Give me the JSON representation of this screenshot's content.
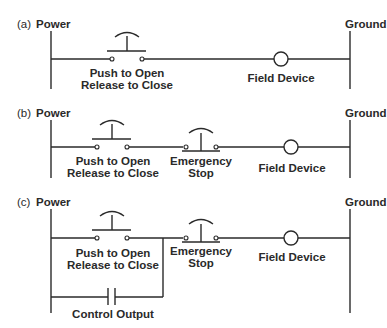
{
  "panels": [
    {
      "tag": "(a)",
      "power_label": "Power",
      "ground_label": "Ground",
      "pushbutton": {
        "line1": "Push to Open",
        "line2": "Release to Close"
      },
      "field_device": "Field Device"
    },
    {
      "tag": "(b)",
      "power_label": "Power",
      "ground_label": "Ground",
      "pushbutton": {
        "line1": "Push to Open",
        "line2": "Release to Close"
      },
      "estop": {
        "line1": "Emergency",
        "line2": "Stop"
      },
      "field_device": "Field Device"
    },
    {
      "tag": "(c)",
      "power_label": "Power",
      "ground_label": "Ground",
      "pushbutton": {
        "line1": "Push to Open",
        "line2": "Release to Close"
      },
      "estop": {
        "line1": "Emergency",
        "line2": "Stop"
      },
      "field_device": "Field Device",
      "control_output": "Control Output"
    }
  ]
}
